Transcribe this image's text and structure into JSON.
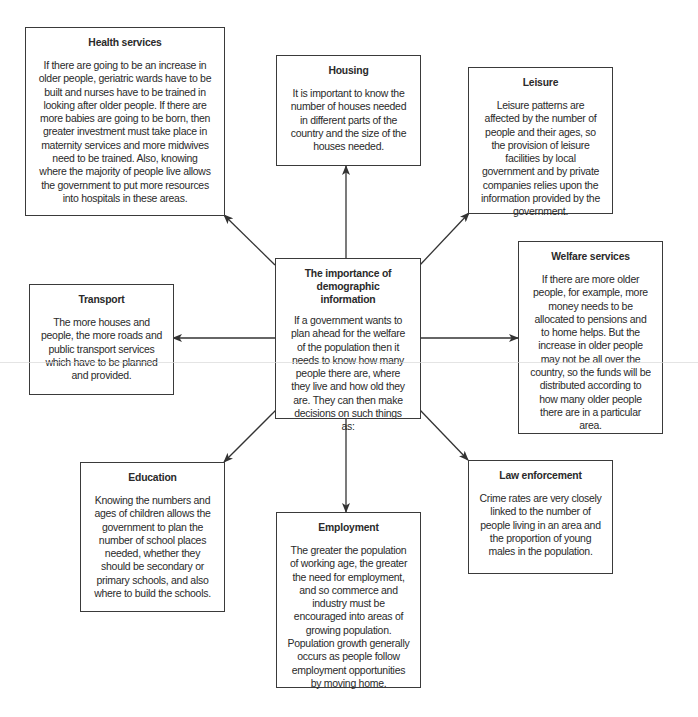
{
  "diagram": {
    "center": {
      "title": "The importance of demographic information",
      "text": "If a government wants to plan ahead for the welfare of the population then it needs to know how many people there are, where they live and how old they are. They can then make decisions on such things as:"
    },
    "nodes": [
      {
        "id": "health",
        "title": "Health services",
        "text": "If there are going to be an increase in older people, geriatric wards have to be built and nurses have to be trained in looking after older people. If there are more babies are going to be born, then greater investment must take place in maternity services and more midwives need to be trained. Also, knowing where the majority of people live allows the government to put more resources into hospitals in these areas."
      },
      {
        "id": "housing",
        "title": "Housing",
        "text": "It is important to know the number of houses needed in different parts of the country and the size of the houses needed."
      },
      {
        "id": "leisure",
        "title": "Leisure",
        "text": "Leisure patterns are affected by the number of people and their ages, so the provision of leisure facilities by local government and by private companies relies upon the information provided by the government."
      },
      {
        "id": "transport",
        "title": "Transport",
        "text": "The more houses and people, the more roads and public transport services which have to be planned and provided."
      },
      {
        "id": "welfare",
        "title": "Welfare services",
        "text": "If there are more older people, for example, more money needs to be allocated to pensions and to home helps. But the increase in older people may not be all over the country, so the funds will be distributed according to how many older people there are in a particular area."
      },
      {
        "id": "education",
        "title": "Education",
        "text": "Knowing the numbers and ages of children allows the government to plan the number of school places needed, whether they should be secondary or primary schools, and also where to build the schools."
      },
      {
        "id": "employment",
        "title": "Employment",
        "text": "The greater the population of working age, the greater the need for employment, and so commerce and industry must be encouraged into areas of growing population. Population growth generally occurs as people follow employment opportunities by moving home."
      },
      {
        "id": "law",
        "title": "Law enforcement",
        "text": "Crime rates are very closely linked to the number of people living in an area and the proportion of young males in the population."
      }
    ],
    "colors": {
      "line": "#333333",
      "text": "#2a2a2a",
      "background": "#ffffff"
    }
  }
}
